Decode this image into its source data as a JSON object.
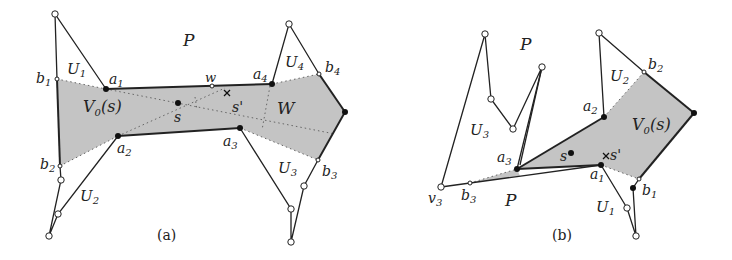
{
  "panels": [
    {
      "id": "a",
      "caption": "(a)",
      "region_label": "V",
      "region_sub": "0",
      "region_arg": "(s)",
      "labels": {
        "P": "P",
        "W": "W",
        "w": "w",
        "s": "s",
        "s_prime": "s'",
        "a": [
          "a",
          "a",
          "a",
          "a"
        ],
        "a_sub": [
          "1",
          "2",
          "3",
          "4"
        ],
        "b": [
          "b",
          "b",
          "b",
          "b"
        ],
        "b_sub": [
          "1",
          "2",
          "3",
          "4"
        ],
        "U": [
          "U",
          "U",
          "U",
          "U"
        ],
        "U_sub": [
          "1",
          "2",
          "3",
          "4"
        ]
      }
    },
    {
      "id": "b",
      "caption": "(b)",
      "region_label": "V",
      "region_sub": "0",
      "region_arg": "(s)",
      "labels": {
        "P_top": "P",
        "P_bottom": "P",
        "s": "s",
        "s_prime": "s'",
        "v3": "v",
        "v3_sub": "3",
        "a": [
          "a",
          "a",
          "a"
        ],
        "a_sub": [
          "1",
          "2",
          "3"
        ],
        "b": [
          "b",
          "b",
          "b"
        ],
        "b_sub": [
          "1",
          "2",
          "3"
        ],
        "U": [
          "U",
          "U",
          "U"
        ],
        "U_sub": [
          "1",
          "2",
          "3"
        ]
      }
    }
  ],
  "colors": {
    "shade": "#c4c4c4",
    "stroke": "#222222",
    "dotted": "#666666"
  }
}
